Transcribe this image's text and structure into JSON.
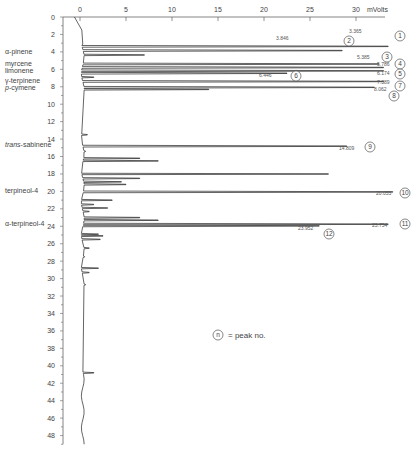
{
  "chart_data": {
    "type": "line",
    "orientation": "vertical-time-axis",
    "title": "",
    "xlabel": "mVolts",
    "ylabel": "",
    "x_axis": {
      "position": "top",
      "range": [
        0,
        32
      ],
      "ticks": [
        0,
        5,
        10,
        15,
        20,
        25,
        30
      ],
      "unit": "mVolts"
    },
    "y_axis": {
      "position": "left",
      "range": [
        0,
        49
      ],
      "ticks": [
        0,
        2,
        4,
        6,
        8,
        10,
        12,
        14,
        16,
        18,
        20,
        22,
        24,
        26,
        28,
        30,
        32,
        34,
        36,
        38,
        40,
        42,
        44,
        46,
        48
      ],
      "reversed": true
    },
    "grid": false,
    "component_labels": [
      {
        "text": "α-pinene",
        "y": 4.0
      },
      {
        "text": "myrcene",
        "y": 5.3
      },
      {
        "text": "limonene",
        "y": 6.1
      },
      {
        "text": "γ-terpinene",
        "y": 7.3
      },
      {
        "text": "p-cymene",
        "y": 8.1
      },
      {
        "text": "trans-sabinene",
        "y": 14.6
      },
      {
        "text": "terpineol-4",
        "y": 19.9
      },
      {
        "text": "α-terpineol-4",
        "y": 23.7
      }
    ],
    "peaks": [
      {
        "no": 1,
        "rt": 3.365,
        "rt_label": "3.365",
        "height": 33.5
      },
      {
        "no": 2,
        "rt": 3.846,
        "rt_label": "3.846",
        "height": 28.5
      },
      {
        "no": 3,
        "rt": 5.385,
        "rt_label": "5.385",
        "height": 32.5
      },
      {
        "no": 4,
        "rt": 5.786,
        "rt_label": "5.786",
        "height": 33.0
      },
      {
        "no": 5,
        "rt": 6.174,
        "rt_label": "6.174",
        "height": 33.0
      },
      {
        "no": 6,
        "rt": 6.446,
        "rt_label": "6.446",
        "height": 22.5
      },
      {
        "no": 7,
        "rt": 7.389,
        "rt_label": "7.389",
        "height": 33.0
      },
      {
        "no": 8,
        "rt": 8.062,
        "rt_label": "8.062",
        "height": 32.0
      },
      {
        "no": 9,
        "rt": 14.809,
        "rt_label": "14.809",
        "height": 29.0
      },
      {
        "no": 10,
        "rt": 20.055,
        "rt_label": "20.055",
        "height": 34.0
      },
      {
        "no": 11,
        "rt": 23.754,
        "rt_label": "23.754",
        "height": 33.5
      },
      {
        "no": 12,
        "rt": 23.952,
        "rt_label": "23.952",
        "height": 26.0
      }
    ],
    "minor_peaks": [
      {
        "rt": 4.35,
        "height": 7.0
      },
      {
        "rt": 6.9,
        "height": 1.5
      },
      {
        "rt": 8.3,
        "height": 14.0
      },
      {
        "rt": 13.5,
        "height": 0.8
      },
      {
        "rt": 15.4,
        "height": 0.6
      },
      {
        "rt": 16.2,
        "height": 6.5
      },
      {
        "rt": 16.5,
        "height": 8.5
      },
      {
        "rt": 18.0,
        "height": 27.0
      },
      {
        "rt": 18.5,
        "height": 6.5
      },
      {
        "rt": 18.9,
        "height": 4.5
      },
      {
        "rt": 19.2,
        "height": 5.0
      },
      {
        "rt": 21.0,
        "height": 3.5
      },
      {
        "rt": 21.5,
        "height": 1.5
      },
      {
        "rt": 21.9,
        "height": 3.0
      },
      {
        "rt": 22.3,
        "height": 1.0
      },
      {
        "rt": 23.0,
        "height": 6.5
      },
      {
        "rt": 23.3,
        "height": 8.5
      },
      {
        "rt": 24.9,
        "height": 2.0
      },
      {
        "rt": 25.1,
        "height": 2.5
      },
      {
        "rt": 25.5,
        "height": 2.2
      },
      {
        "rt": 26.5,
        "height": 1.0
      },
      {
        "rt": 27.5,
        "height": 0.5
      },
      {
        "rt": 28.8,
        "height": 2.0
      },
      {
        "rt": 29.3,
        "height": 1.0
      },
      {
        "rt": 30.7,
        "height": 0.6
      },
      {
        "rt": 40.8,
        "height": 1.5
      }
    ],
    "legend": {
      "symbol": "n",
      "text": "= peak no."
    }
  },
  "legend": {
    "symbol": "n",
    "text": "= peak no."
  },
  "axis": {
    "unit_label": "mVolts"
  }
}
